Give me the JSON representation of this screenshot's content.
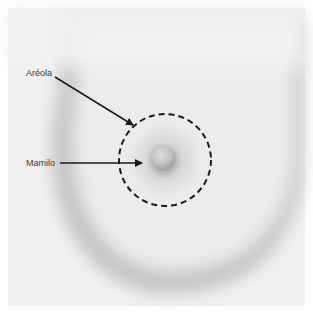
{
  "diagram": {
    "type": "anatomical-illustration",
    "labels": [
      {
        "id": "areola",
        "text": "Aréola",
        "x": 26,
        "y": 68
      },
      {
        "id": "nipple",
        "text": "Mamilo",
        "x": 26,
        "y": 158
      }
    ],
    "arrows": [
      {
        "from": "areola",
        "x1": 55,
        "y1": 77,
        "x2": 133,
        "y2": 125
      },
      {
        "from": "nipple",
        "x1": 60,
        "y1": 163,
        "x2": 142,
        "y2": 163
      }
    ],
    "areola_circle": {
      "cx": 165,
      "cy": 160,
      "r": 46,
      "style": "dashed"
    },
    "nipple": {
      "cx": 163,
      "cy": 158,
      "r": 13
    },
    "colors": {
      "background": "#f2f2f2",
      "shadow": "#9a9a9a",
      "line": "#1a1a1a",
      "text": "#3a3a3a"
    }
  }
}
